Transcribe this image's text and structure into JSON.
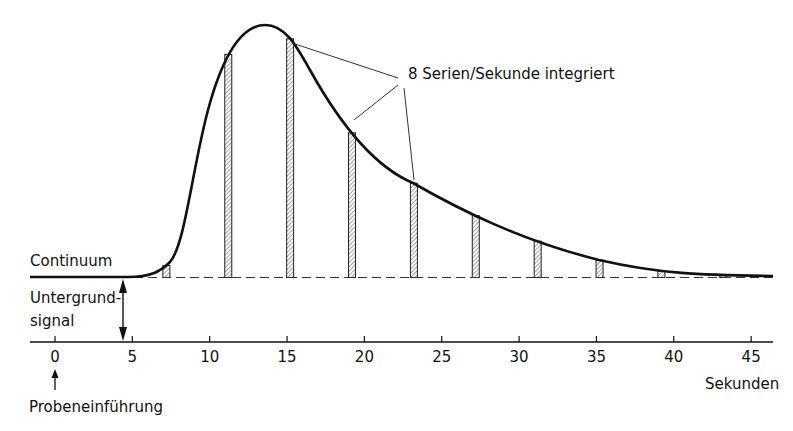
{
  "chart_data": {
    "type": "line",
    "title": "",
    "xlabel": "Sekunden",
    "ylabel": "",
    "x_ticks": [
      0,
      5,
      10,
      15,
      20,
      25,
      30,
      35,
      40,
      45
    ],
    "xlim": [
      -1.5,
      46.5
    ],
    "grid": false,
    "legend": null,
    "series": [
      {
        "name": "Signal (Continuum + Peak)",
        "description": "Transient signal peak above background, rising after ~4.5 s, max at ~13.7 s, decaying toward baseline by ~45 s",
        "x": [
          4.5,
          6,
          7,
          8,
          9,
          10,
          11,
          12,
          13,
          13.7,
          15,
          17,
          19,
          21,
          23,
          25,
          27,
          29,
          31,
          33,
          35,
          37,
          39,
          41,
          43,
          45,
          46.5
        ],
        "y_relative": [
          0,
          0.03,
          0.09,
          0.22,
          0.42,
          0.62,
          0.8,
          0.93,
          0.99,
          1.0,
          0.95,
          0.78,
          0.61,
          0.48,
          0.37,
          0.29,
          0.23,
          0.17,
          0.13,
          0.09,
          0.06,
          0.04,
          0.03,
          0.02,
          0.015,
          0.01,
          0.008
        ]
      }
    ],
    "integration_bars": {
      "description": "Hatched integration windows (every 4 s)",
      "x": [
        7.2,
        11.2,
        15.2,
        19.2,
        23.2,
        27.2,
        31.2,
        35.2,
        39.2,
        43.2
      ]
    },
    "annotations": [
      {
        "text": "8 Serien/Sekunde integriert",
        "points_to_x": [
          15.2,
          19.2,
          23.2
        ]
      },
      {
        "text": "Continuum",
        "position": "left, above baseline"
      },
      {
        "text": "Untergrund-",
        "position": "left, between baseline and axis"
      },
      {
        "text": "signal",
        "position": "left, between baseline and axis"
      },
      {
        "text": "Probeneinführung",
        "points_to_x": 0
      }
    ]
  },
  "labels": {
    "continuum": "Continuum",
    "background_line1": "Untergrund-",
    "background_line2": "signal",
    "annotation": "8 Serien/Sekunde integriert",
    "x_unit": "Sekunden",
    "injection": "Probeneinführung",
    "ticks": [
      "0",
      "5",
      "10",
      "15",
      "20",
      "25",
      "30",
      "35",
      "40",
      "45"
    ]
  }
}
